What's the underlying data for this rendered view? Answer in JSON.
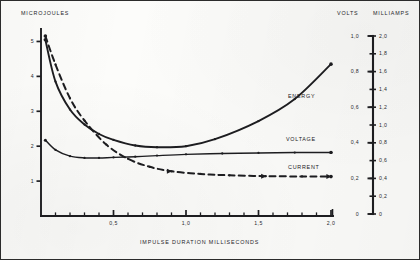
{
  "chart_data": {
    "type": "line",
    "title": "",
    "xlabel": "IMPULSE  DURATION    MILLISECONDS",
    "xlim": [
      0,
      2.0
    ],
    "x_ticks_major": [
      "0,5",
      "1,0",
      "1,5",
      "2,0"
    ],
    "x_ticks_major_values": [
      0.5,
      1.0,
      1.5,
      2.0
    ],
    "x_tick_minor_step": 0.1,
    "grid": false,
    "legend": "inline-labels",
    "axes": [
      {
        "id": "left",
        "label": "MICROJOULES",
        "position": "left",
        "lim": [
          0,
          5.3
        ],
        "ticks": [
          "1",
          "2",
          "3",
          "4",
          "5"
        ],
        "tick_values": [
          1,
          2,
          3,
          4,
          5
        ]
      },
      {
        "id": "volts",
        "label": "VOLTS",
        "position": "right-inner",
        "lim": [
          0,
          1.0
        ],
        "ticks": [
          "0",
          "0,2",
          "0,4",
          "0,6",
          "0,8",
          "1,0"
        ],
        "tick_values": [
          0,
          0.2,
          0.4,
          0.6,
          0.8,
          1.0
        ]
      },
      {
        "id": "milliamps",
        "label": "MILLIAMPS",
        "position": "right-outer",
        "lim": [
          0,
          2.0
        ],
        "ticks": [
          "0",
          "0,2",
          "0,4",
          "0,6",
          "0,8",
          "1,0",
          "1,2",
          "1,4",
          "1,6",
          "1,8",
          "2,0"
        ],
        "tick_values": [
          0,
          0.2,
          0.4,
          0.6,
          0.8,
          1.0,
          1.2,
          1.4,
          1.6,
          1.8,
          2.0
        ]
      }
    ],
    "series": [
      {
        "name": "ENERGY",
        "axis": "left",
        "style": "solid",
        "label": "ENERGY",
        "x": [
          0.03,
          0.1,
          0.2,
          0.3,
          0.4,
          0.5,
          0.65,
          0.8,
          1.0,
          1.2,
          1.5,
          1.75,
          2.0
        ],
        "y": [
          5.05,
          3.85,
          3.05,
          2.62,
          2.35,
          2.18,
          2.02,
          1.97,
          2.0,
          2.2,
          2.72,
          3.35,
          4.35
        ]
      },
      {
        "name": "VOLTAGE",
        "axis": "volts",
        "style": "solid",
        "label": "VOLTAGE",
        "x": [
          0.03,
          0.1,
          0.2,
          0.3,
          0.4,
          0.5,
          0.65,
          0.8,
          1.0,
          1.25,
          1.5,
          1.75,
          2.0
        ],
        "y": [
          0.415,
          0.36,
          0.325,
          0.315,
          0.315,
          0.318,
          0.322,
          0.328,
          0.335,
          0.34,
          0.343,
          0.345,
          0.346
        ]
      },
      {
        "name": "CURRENT",
        "axis": "milliamps",
        "style": "dashed",
        "label": "CURRENT",
        "x": [
          0.03,
          0.1,
          0.2,
          0.3,
          0.45,
          0.6,
          0.75,
          0.9,
          1.1,
          1.3,
          1.55,
          1.8,
          2.0
        ],
        "y": [
          2.0,
          1.68,
          1.3,
          1.05,
          0.78,
          0.62,
          0.53,
          0.48,
          0.45,
          0.435,
          0.425,
          0.422,
          0.42
        ]
      }
    ]
  }
}
